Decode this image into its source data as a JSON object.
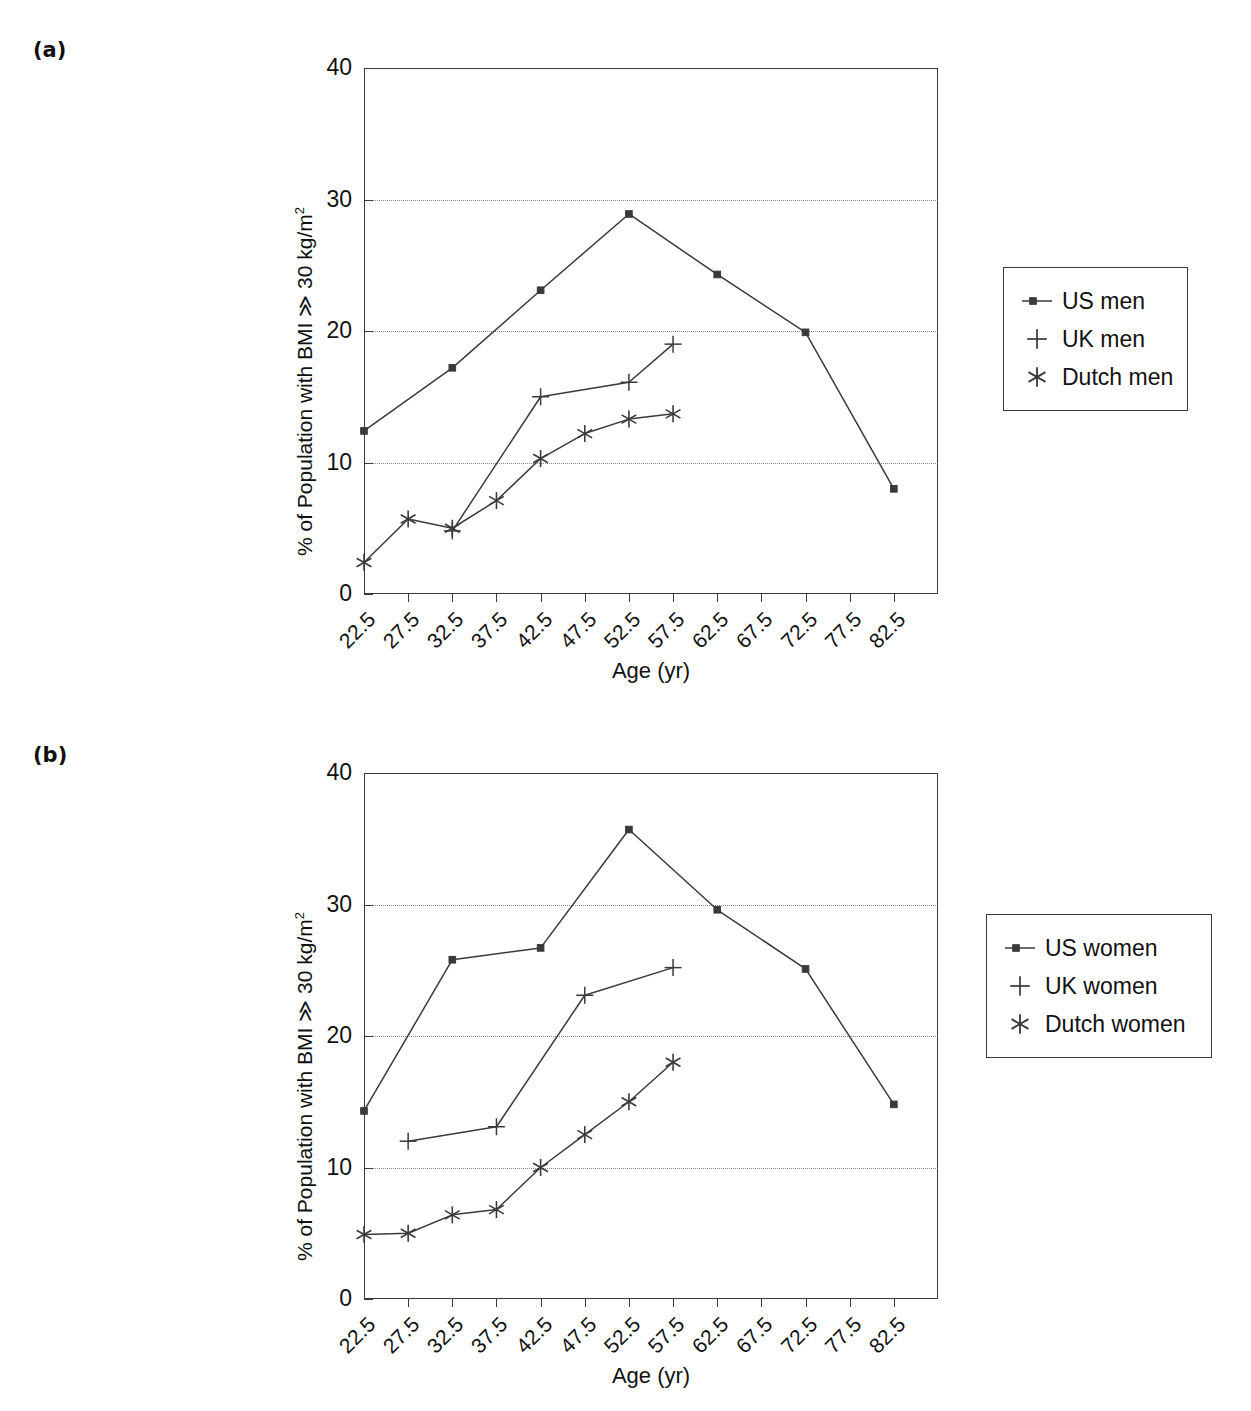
{
  "figure": {
    "panels": [
      {
        "tag": "(a)",
        "name": "panel-a"
      },
      {
        "tag": "(b)",
        "name": "panel-b"
      }
    ]
  },
  "chart_data": [
    {
      "type": "line",
      "panel": "(a)",
      "title": "",
      "xlabel": "Age (yr)",
      "ylabel": "% of Population with BMI ≫ 30 kg/m",
      "ylabel_superscript": "2",
      "categories": [
        "22.5",
        "27.5",
        "32.5",
        "37.5",
        "42.5",
        "47.5",
        "52.5",
        "57.5",
        "62.5",
        "67.5",
        "72.5",
        "77.5",
        "82.5"
      ],
      "ylim": [
        0,
        40
      ],
      "yticks": [
        0,
        10,
        20,
        30,
        40
      ],
      "grid": "horizontal-dotted",
      "gridlines": [
        10,
        20,
        30
      ],
      "legend_position": "right-outside",
      "series": [
        {
          "name": "US men",
          "marker": "square",
          "x": [
            "22.5",
            "32.5",
            "42.5",
            "52.5",
            "57.5",
            "62.5",
            "72.5",
            "82.5"
          ],
          "values": [
            12.4,
            17.2,
            23.1,
            28.9,
            24.3,
            24.3,
            19.9,
            8.0
          ],
          "points": [
            {
              "x": "22.5",
              "y": 12.4
            },
            {
              "x": "32.5",
              "y": 17.2
            },
            {
              "x": "42.5",
              "y": 23.1
            },
            {
              "x": "52.5",
              "y": 28.9
            },
            {
              "x": "62.5",
              "y": 24.3
            },
            {
              "x": "72.5",
              "y": 19.9
            },
            {
              "x": "82.5",
              "y": 8.0
            }
          ]
        },
        {
          "name": "UK men",
          "marker": "plus",
          "points": [
            {
              "x": "32.5",
              "y": 4.8
            },
            {
              "x": "42.5",
              "y": 15.0
            },
            {
              "x": "52.5",
              "y": 16.1
            },
            {
              "x": "57.5",
              "y": 19.0
            }
          ]
        },
        {
          "name": "Dutch men",
          "marker": "asterisk",
          "points": [
            {
              "x": "22.5",
              "y": 2.4
            },
            {
              "x": "27.5",
              "y": 5.7
            },
            {
              "x": "32.5",
              "y": 5.0
            },
            {
              "x": "37.5",
              "y": 7.1
            },
            {
              "x": "42.5",
              "y": 10.3
            },
            {
              "x": "47.5",
              "y": 12.2
            },
            {
              "x": "52.5",
              "y": 13.3
            },
            {
              "x": "57.5",
              "y": 13.7
            }
          ]
        }
      ],
      "legend": [
        {
          "label": "US men",
          "marker": "square"
        },
        {
          "label": "UK men",
          "marker": "plus"
        },
        {
          "label": "Dutch men",
          "marker": "asterisk"
        }
      ]
    },
    {
      "type": "line",
      "panel": "(b)",
      "title": "",
      "xlabel": "Age (yr)",
      "ylabel": "% of Population with BMI ≫ 30 kg/m",
      "ylabel_superscript": "2",
      "categories": [
        "22.5",
        "27.5",
        "32.5",
        "37.5",
        "42.5",
        "47.5",
        "52.5",
        "57.5",
        "62.5",
        "67.5",
        "72.5",
        "77.5",
        "82.5"
      ],
      "ylim": [
        0,
        40
      ],
      "yticks": [
        0,
        10,
        20,
        30,
        40
      ],
      "grid": "horizontal-dotted",
      "gridlines": [
        10,
        20,
        30
      ],
      "legend_position": "right-outside",
      "series": [
        {
          "name": "US women",
          "marker": "square",
          "points": [
            {
              "x": "22.5",
              "y": 14.3
            },
            {
              "x": "32.5",
              "y": 25.8
            },
            {
              "x": "42.5",
              "y": 26.7
            },
            {
              "x": "52.5",
              "y": 35.7
            },
            {
              "x": "62.5",
              "y": 29.6
            },
            {
              "x": "72.5",
              "y": 25.1
            },
            {
              "x": "82.5",
              "y": 14.8
            }
          ]
        },
        {
          "name": "UK women",
          "marker": "plus",
          "points": [
            {
              "x": "27.5",
              "y": 12.0
            },
            {
              "x": "37.5",
              "y": 13.1
            },
            {
              "x": "47.5",
              "y": 23.1
            },
            {
              "x": "57.5",
              "y": 25.2
            }
          ]
        },
        {
          "name": "Dutch women",
          "marker": "asterisk",
          "points": [
            {
              "x": "22.5",
              "y": 4.9
            },
            {
              "x": "27.5",
              "y": 5.0
            },
            {
              "x": "32.5",
              "y": 6.4
            },
            {
              "x": "37.5",
              "y": 6.8
            },
            {
              "x": "42.5",
              "y": 10.0
            },
            {
              "x": "47.5",
              "y": 12.5
            },
            {
              "x": "52.5",
              "y": 15.0
            },
            {
              "x": "57.5",
              "y": 18.0
            }
          ]
        }
      ],
      "legend": [
        {
          "label": "US women",
          "marker": "square"
        },
        {
          "label": "UK women",
          "marker": "plus"
        },
        {
          "label": "Dutch women",
          "marker": "asterisk"
        }
      ]
    }
  ],
  "colors": {
    "line": "#3a3a3a",
    "text": "#111111",
    "grid": "#8c8c8c",
    "background": "#ffffff"
  }
}
